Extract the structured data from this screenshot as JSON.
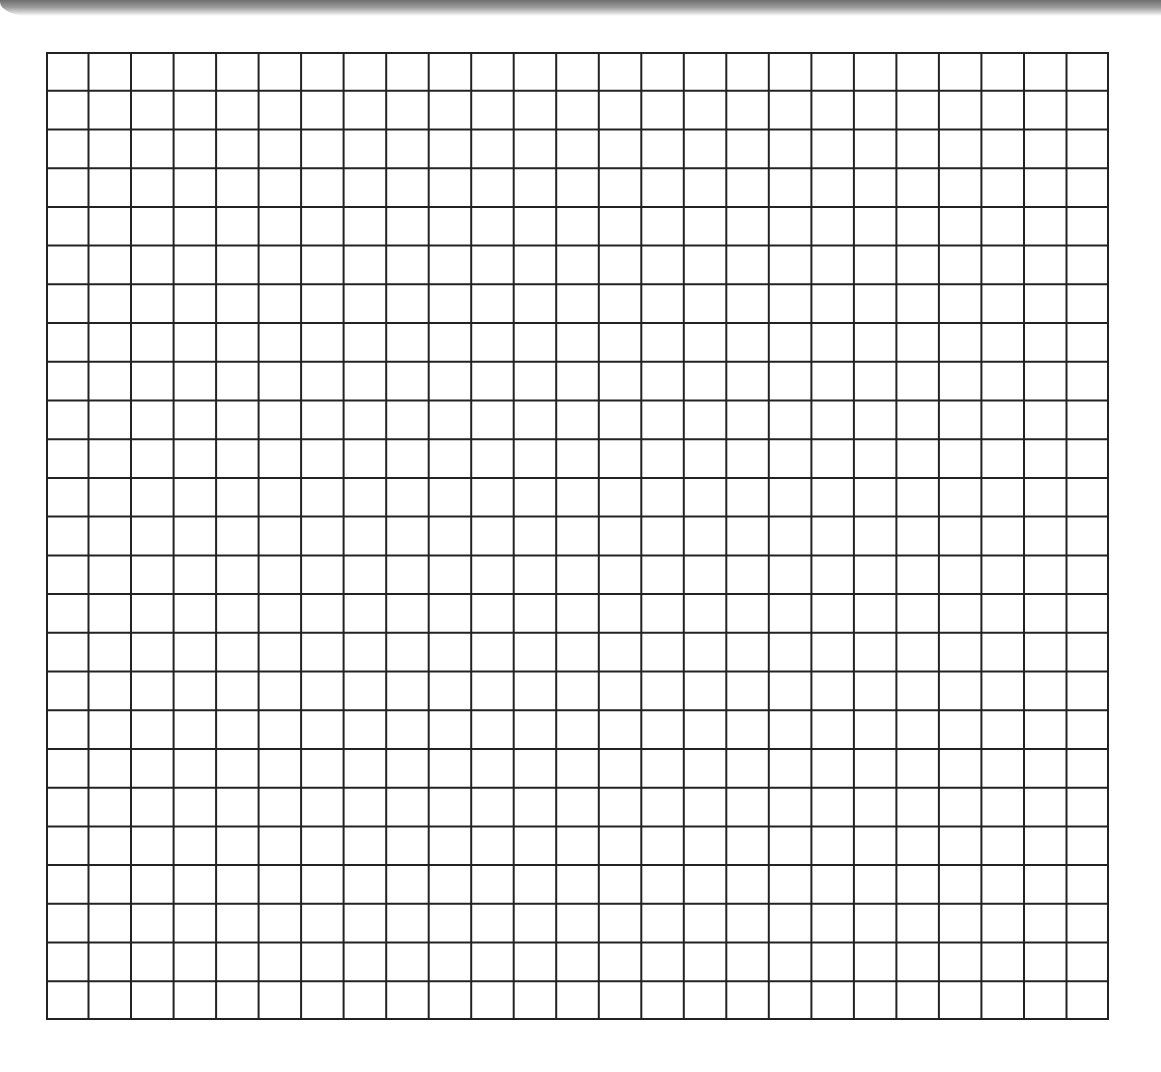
{
  "grid": {
    "columns": 25,
    "rows": 25,
    "line_color": "#222222",
    "background_color": "#ffffff"
  }
}
